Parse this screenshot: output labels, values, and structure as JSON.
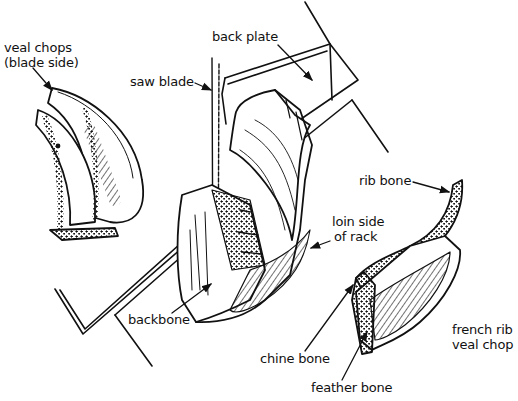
{
  "diagram": {
    "labels": {
      "veal_chops_line1": "veal chops",
      "veal_chops_line2": "(blade side)",
      "saw_blade": "saw blade",
      "back_plate": "back plate",
      "rib_bone": "rib bone",
      "loin_side_line1": "loin side",
      "loin_side_line2": "of rack",
      "backbone": "backbone",
      "chine_bone": "chine bone",
      "feather_bone": "feather bone",
      "french_rib_line1": "french rib",
      "french_rib_line2": "veal chop"
    },
    "colors": {
      "ink": "#111111",
      "paper": "#ffffff"
    }
  }
}
